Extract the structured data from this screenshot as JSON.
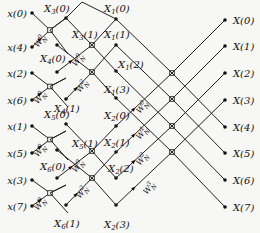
{
  "colors": {
    "line": "#222222",
    "background": "#f7f7f5",
    "text": "#111111"
  },
  "inputs": [
    {
      "label": "x(0)",
      "y": 13
    },
    {
      "label": "x(4)",
      "y": 47
    },
    {
      "label": "x(2)",
      "y": 73
    },
    {
      "label": "x(6)",
      "y": 100
    },
    {
      "label": "x(1)",
      "y": 126
    },
    {
      "label": "x(5)",
      "y": 153
    },
    {
      "label": "x(3)",
      "y": 180
    },
    {
      "label": "x(7)",
      "y": 206
    }
  ],
  "stage1_outputs": [
    {
      "label": "X3(0)",
      "sub": "3",
      "idx": "0"
    },
    {
      "label": "X3(1)",
      "sub": "3",
      "idx": "1"
    },
    {
      "label": "X4(0)",
      "sub": "4",
      "idx": "0"
    },
    {
      "label": "X4(1)",
      "sub": "4",
      "idx": "1"
    },
    {
      "label": "X5(0)",
      "sub": "5",
      "idx": "0"
    },
    {
      "label": "X5(1)",
      "sub": "5",
      "idx": "1"
    },
    {
      "label": "X6(0)",
      "sub": "6",
      "idx": "0"
    },
    {
      "label": "X6(1)",
      "sub": "6",
      "idx": "1"
    }
  ],
  "stage2_outputs": [
    {
      "label": "X1(0)",
      "sub": "1",
      "idx": "0"
    },
    {
      "label": "X1(1)",
      "sub": "1",
      "idx": "1"
    },
    {
      "label": "X1(2)",
      "sub": "1",
      "idx": "2"
    },
    {
      "label": "X1(3)",
      "sub": "1",
      "idx": "3"
    },
    {
      "label": "X2(0)",
      "sub": "2",
      "idx": "0"
    },
    {
      "label": "X2(1)",
      "sub": "2",
      "idx": "1"
    },
    {
      "label": "X2(2)",
      "sub": "2",
      "idx": "2"
    },
    {
      "label": "X2(3)",
      "sub": "2",
      "idx": "3"
    }
  ],
  "outputs": [
    {
      "label": "X(0)",
      "y": 20
    },
    {
      "label": "X(1)",
      "y": 46
    },
    {
      "label": "X(2)",
      "y": 73
    },
    {
      "label": "X(3)",
      "y": 100
    },
    {
      "label": "X(4)",
      "y": 127
    },
    {
      "label": "X(5)",
      "y": 153
    },
    {
      "label": "X(6)",
      "y": 180
    },
    {
      "label": "X(7)",
      "y": 207
    }
  ],
  "twiddles": {
    "stage1": [
      "W_N^0",
      "W_N^0",
      "W_N^0",
      "W_N^0"
    ],
    "stage2": [
      "W_N^0",
      "W_N^2",
      "W_N^0",
      "W_N^2"
    ],
    "stage3": [
      "W_N^0",
      "W_N^1",
      "W_N^2",
      "W_N^3"
    ]
  }
}
